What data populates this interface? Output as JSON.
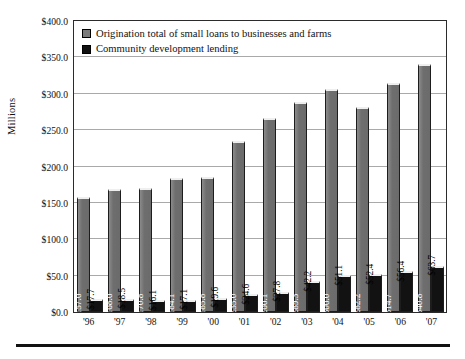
{
  "chart_data": {
    "type": "bar",
    "title": "",
    "subtitle": "",
    "xlabel": "",
    "ylabel": "Millions",
    "ylim": [
      0,
      400
    ],
    "ytick_labels": [
      "$400.0",
      "$350.0",
      "$300.0",
      "$250.0",
      "$200.0",
      "$150.0",
      "$100.0",
      "$50.0",
      "$0.0"
    ],
    "ytick_values": [
      400,
      350,
      300,
      250,
      200,
      150,
      100,
      50,
      0
    ],
    "grid": true,
    "legend_position": "top-left",
    "categories": [
      "'96",
      "'97",
      "'98",
      "'99",
      "'00",
      "'01",
      "'02",
      "'03",
      "'04",
      "'05",
      "'06",
      "'07"
    ],
    "series": [
      {
        "name": "Origination total of small loans to businesses and farms",
        "color": "#6f6f6f",
        "values": [
          157.6,
          168.6,
          170.8,
          184.1,
          185.8,
          235.0,
          266.1,
          289.3,
          306.0,
          282.2,
          314.7,
          340.8
        ],
        "labels": [
          "$157.6",
          "$168.6",
          "$170.8",
          "$184.1",
          "$185.8",
          "$235.0",
          "$266.1",
          "$289.3",
          "$306.0",
          "$282.2",
          "$314.7",
          "$340.8"
        ]
      },
      {
        "name": "Community development lending",
        "color": "#121212",
        "values": [
          17.7,
          18.5,
          16.1,
          17.1,
          19.6,
          24.6,
          27.8,
          42.2,
          51.1,
          52.4,
          56.4,
          63.7
        ],
        "labels": [
          "$17.7",
          "$18.5",
          "$16.1",
          "$17.1",
          "$19.6",
          "$24.6",
          "$27.8",
          "$42.2",
          "$51.1",
          "$52.4",
          "$56.4",
          "$63.7"
        ]
      }
    ]
  },
  "legend": {
    "items": [
      {
        "label": "Origination total of small loans to businesses and farms",
        "swatch": "legend-swatch-gray"
      },
      {
        "label": "Community development lending",
        "swatch": "legend-swatch-black"
      }
    ]
  }
}
